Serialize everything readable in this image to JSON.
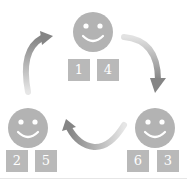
{
  "diagram": {
    "colors": {
      "face": "#b3b3b3",
      "box": "#b9b9b9",
      "box_text": "#ffffff",
      "arrow_dark": "#8a8a8a",
      "arrow_light": "#dedede"
    },
    "nodes": [
      {
        "id": "top",
        "icon": "smiley-face-icon",
        "labels": [
          "1",
          "4"
        ]
      },
      {
        "id": "bottom-right",
        "icon": "smiley-face-icon",
        "labels": [
          "6",
          "3"
        ]
      },
      {
        "id": "bottom-left",
        "icon": "smiley-face-icon",
        "labels": [
          "2",
          "5"
        ]
      }
    ],
    "edges": [
      {
        "from": "top",
        "to": "bottom-right",
        "direction": "clockwise"
      },
      {
        "from": "bottom-right",
        "to": "bottom-left",
        "direction": "clockwise"
      },
      {
        "from": "bottom-left",
        "to": "top",
        "direction": "clockwise"
      }
    ]
  }
}
